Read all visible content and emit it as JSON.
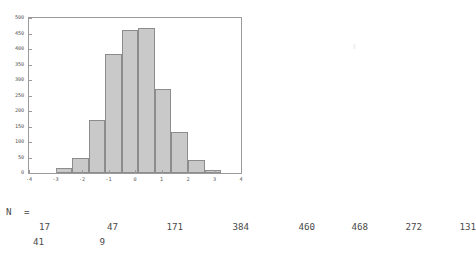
{
  "chart_data": {
    "type": "bar",
    "title": "",
    "subtitle": "",
    "xlabel": "",
    "ylabel": "",
    "grid": false,
    "legend": false,
    "xlim": [
      -4,
      4
    ],
    "ylim": [
      0,
      500
    ],
    "xticks": [
      "-4",
      "-3",
      "-2",
      "-1",
      "0",
      "1",
      "2",
      "3",
      "4"
    ],
    "xtick_values": [
      -4,
      -3,
      -2,
      -1,
      0,
      1,
      2,
      3,
      4
    ],
    "yticks": [
      "0",
      "50",
      "100",
      "150",
      "200",
      "250",
      "300",
      "350",
      "400",
      "450",
      "500"
    ],
    "ytick_values": [
      0,
      50,
      100,
      150,
      200,
      250,
      300,
      350,
      400,
      450,
      500
    ],
    "bin_width": 0.625,
    "bin_left_edges": [
      -3.0,
      -2.375,
      -1.75,
      -1.125,
      -0.5,
      0.125,
      0.75,
      1.375,
      2.0,
      2.625
    ],
    "categories": [
      "-3.0",
      "-2.375",
      "-1.75",
      "-1.125",
      "-0.5",
      "0.125",
      "0.75",
      "1.375",
      "2.0",
      "2.625"
    ],
    "values": [
      17,
      47,
      171,
      384,
      460,
      468,
      272,
      131,
      41,
      9
    ],
    "bar_fill_color": "#c9c9c9",
    "bar_border_color": "#8c8c8c",
    "axis_color": "#9a9a9a"
  },
  "counts_panel": {
    "label": "N  =",
    "row1": [
      {
        "value": "17",
        "right": 50
      },
      {
        "value": "47",
        "right": 118
      },
      {
        "value": "171",
        "right": 183
      },
      {
        "value": "384",
        "right": 249
      },
      {
        "value": "460",
        "right": 315
      },
      {
        "value": "468",
        "right": 368
      },
      {
        "value": "272",
        "right": 422
      },
      {
        "value": "131",
        "right": 476
      }
    ],
    "row2": [
      {
        "value": "41",
        "right": 44
      },
      {
        "value": "9",
        "right": 105
      }
    ]
  }
}
